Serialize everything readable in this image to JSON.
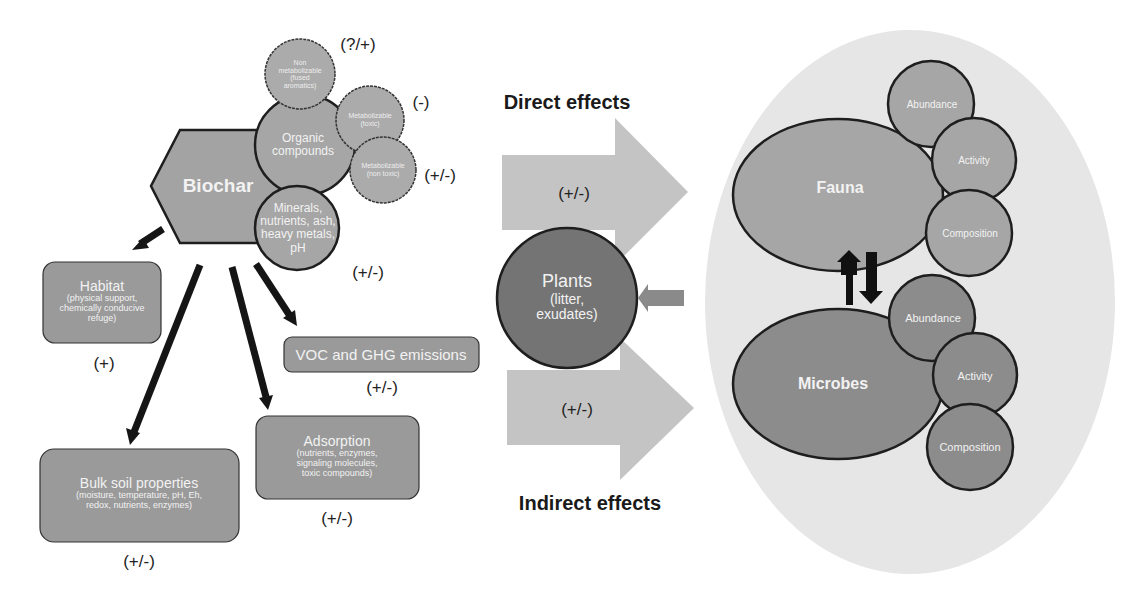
{
  "biochar": {
    "title": "Biochar",
    "components": {
      "organic": "Organic compounds",
      "minerals": [
        "Minerals,",
        "nutrients, ash,",
        "heavy metals,",
        "pH"
      ],
      "non_metabolizable": [
        "Non",
        "metabolizable",
        "(fused",
        "aromatics)"
      ],
      "metabolizable_toxic": [
        "Metabolizable",
        "(toxic)"
      ],
      "metabolizable_nontoxic": [
        "Metabolizable",
        "(non toxic)"
      ]
    },
    "signs": {
      "non_metabolizable": "(?/+)",
      "metabolizable_toxic": "(-)",
      "metabolizable_nontoxic": "(+/-)",
      "minerals": "(+/-)"
    }
  },
  "effects_boxes": {
    "habitat": {
      "title": "Habitat",
      "detail": [
        "(physical support,",
        "chemically conducive",
        "refuge)"
      ],
      "sign": "(+)"
    },
    "voc": {
      "title": "VOC and GHG emissions",
      "sign": "(+/-)"
    },
    "adsorption": {
      "title": "Adsorption",
      "detail": [
        "(nutrients, enzymes,",
        "signaling molecules,",
        "toxic compounds)"
      ],
      "sign": "(+/-)"
    },
    "bulk_soil": {
      "title": "Bulk soil properties",
      "detail": [
        "(moisture, temperature, pH, Eh,",
        "redox, nutrients, enzymes)"
      ],
      "sign": "(+/-)"
    }
  },
  "middle": {
    "direct_label": "Direct effects",
    "indirect_label": "Indirect effects",
    "direct_sign": "(+/-)",
    "indirect_sign": "(+/-)",
    "plants": {
      "title": "Plants",
      "detail": [
        "(litter,",
        "exudates)"
      ]
    }
  },
  "soil_biota": {
    "fauna": {
      "title": "Fauna",
      "attributes": [
        "Abundance",
        "Activity",
        "Composition"
      ]
    },
    "microbes": {
      "title": "Microbes",
      "attributes": [
        "Abundance",
        "Activity",
        "Composition"
      ]
    }
  },
  "colors": {
    "box_fill": "#9a9a9a",
    "circle_fill": "#a8a8a8",
    "arrow_fill": "#c4c4c4",
    "ellipse_bg": "#e6e6e6",
    "plants_fill": "#747474",
    "microbes_fill": "#8c8c8c",
    "stroke": "#1e1e1e"
  }
}
